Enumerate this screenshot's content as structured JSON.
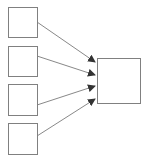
{
  "diagram": {
    "title": "",
    "colors": {
      "stroke": "#808080",
      "arrow": "#333333",
      "fill": "#ffffff"
    },
    "source_boxes": [
      {
        "id": "box-1",
        "x": 8,
        "y": 7,
        "w": 29,
        "h": 30,
        "label": ""
      },
      {
        "id": "box-2",
        "x": 8,
        "y": 46,
        "w": 29,
        "h": 30,
        "label": ""
      },
      {
        "id": "box-3",
        "x": 8,
        "y": 84,
        "w": 29,
        "h": 31,
        "label": ""
      },
      {
        "id": "box-4",
        "x": 8,
        "y": 123,
        "w": 29,
        "h": 31,
        "label": ""
      }
    ],
    "target_box": {
      "id": "target",
      "x": 97,
      "y": 58,
      "w": 43,
      "h": 45,
      "label": ""
    },
    "arrows": [
      {
        "from": "box-1",
        "to": "target",
        "x1": 37,
        "y1": 22,
        "x2": 95,
        "y2": 62
      },
      {
        "from": "box-2",
        "to": "target",
        "x1": 37,
        "y1": 56,
        "x2": 95,
        "y2": 75
      },
      {
        "from": "box-3",
        "to": "target",
        "x1": 37,
        "y1": 105,
        "x2": 95,
        "y2": 86
      },
      {
        "from": "box-4",
        "to": "target",
        "x1": 37,
        "y1": 136,
        "x2": 95,
        "y2": 99
      }
    ]
  }
}
